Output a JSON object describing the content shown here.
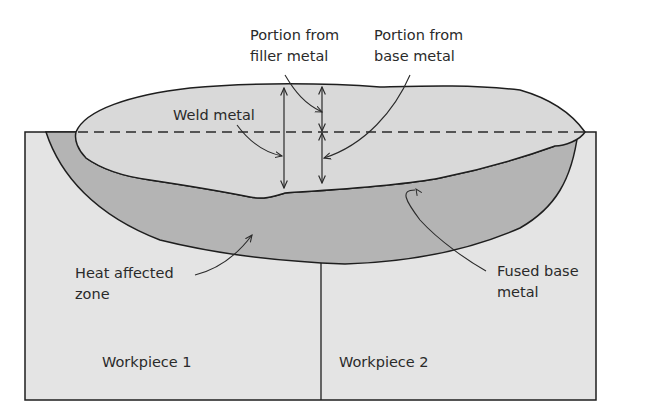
{
  "figure": {
    "type": "weld cross-section diagram",
    "labels": {
      "filler_portion": [
        "Portion from",
        "filler metal"
      ],
      "base_portion": [
        "Portion from",
        "base metal"
      ],
      "weld_metal": "Weld metal",
      "heat_affected_zone": [
        "Heat affected",
        "zone"
      ],
      "fused_base_metal": [
        "Fused base",
        "metal"
      ],
      "workpiece_1": "Workpiece 1",
      "workpiece_2": "Workpiece 2"
    },
    "colors": {
      "background": "#ffffff",
      "workpiece_fill": "#e4e4e4",
      "haz_fill": "#b4b4b4",
      "fused_fill": "#9c9c9c",
      "weld_fill": "#d9d9d9",
      "outline": "#1e1e1e"
    }
  }
}
